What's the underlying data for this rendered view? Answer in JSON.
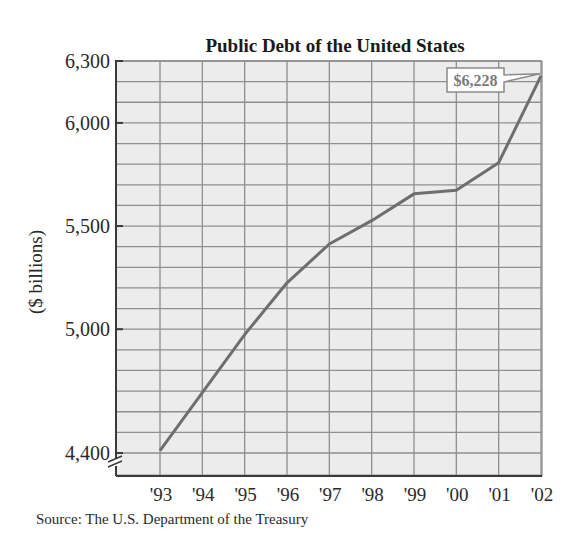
{
  "chart_data": {
    "type": "line",
    "title": "Public Debt of the United States",
    "xlabel": "",
    "ylabel": "($ billions)",
    "categories": [
      "'93",
      "'94",
      "'95",
      "'96",
      "'97",
      "'98",
      "'99",
      "'00",
      "'01",
      "'02"
    ],
    "series": [
      {
        "name": "Public Debt",
        "values": [
          4411,
          4693,
          4974,
          5225,
          5413,
          5526,
          5656,
          5674,
          5807,
          6228
        ]
      }
    ],
    "ylim": [
      4400,
      6300
    ],
    "yticks": [
      4400,
      5000,
      5500,
      6000,
      6300
    ],
    "ytick_labels": [
      "4,400",
      "5,000",
      "5,500",
      "6,000",
      "6,300"
    ],
    "grid": true,
    "grid_step": 100,
    "axis_break": true,
    "annotations": [
      {
        "text": "$6,228",
        "category": "'02",
        "value": 6228
      }
    ],
    "source": "Source: The U.S. Department of the Treasury",
    "legend": null
  },
  "colors": {
    "plot_background": "#ececec",
    "grid_line": "#8f8f8f",
    "axis_line": "#3a3a3a",
    "data_line": "#6e6e6e",
    "callout_border": "#8a8a8a",
    "callout_fill": "#ffffff",
    "callout_text": "#7a7a7a"
  }
}
